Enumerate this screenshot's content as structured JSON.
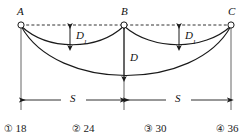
{
  "figure": {
    "type": "physics-diagram",
    "points": [
      {
        "id": "A",
        "label": "A",
        "x": 21,
        "y": 25
      },
      {
        "id": "B",
        "label": "B",
        "x": 124,
        "y": 25
      },
      {
        "id": "C",
        "label": "C",
        "x": 231,
        "y": 25
      }
    ],
    "dimension_labels": {
      "sag_small_left": {
        "label": "D",
        "subscript": "1"
      },
      "sag_small_right": {
        "label": "D",
        "subscript": "1"
      },
      "sag_large": {
        "label": "D",
        "subscript": ""
      },
      "span_left": {
        "label": "S",
        "subscript": ""
      },
      "span_right": {
        "label": "S",
        "subscript": ""
      }
    },
    "colors": {
      "line": "#1a1a1a",
      "dashed_line": "#333333",
      "background": "#ffffff",
      "text": "#1a1a1a"
    }
  },
  "options": [
    {
      "number": "①",
      "value": "18"
    },
    {
      "number": "②",
      "value": "24"
    },
    {
      "number": "③",
      "value": "30"
    },
    {
      "number": "④",
      "value": "36"
    }
  ]
}
